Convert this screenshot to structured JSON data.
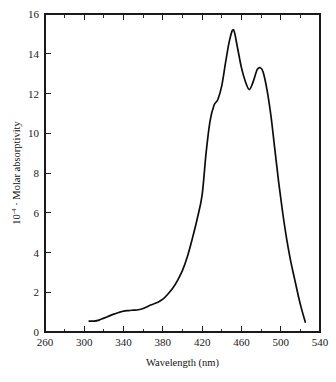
{
  "figure": {
    "background_color": "#ffffff",
    "ink_color": "#0d0d0d"
  },
  "chart_data": {
    "type": "line",
    "title": "",
    "subtitle": "",
    "xlabel": "Wavelength (nm)",
    "ylabel_prefix": "10",
    "ylabel_exponent": "-4",
    "ylabel_separator": " · ",
    "ylabel_text": "Molar absorptivity",
    "ylabel": "10-4 · Molar absorptivity",
    "xlim": [
      260,
      540
    ],
    "ylim": [
      0,
      16
    ],
    "x_major_ticks": [
      260,
      300,
      340,
      380,
      420,
      460,
      500,
      540
    ],
    "x_tick_labels": [
      "260",
      "300",
      "340",
      "380",
      "420",
      "460",
      "500",
      "540"
    ],
    "x_minor_ticks": [
      280,
      320,
      360,
      400,
      440,
      480,
      520
    ],
    "y_major_ticks": [
      0,
      2,
      4,
      6,
      8,
      10,
      12,
      14,
      16
    ],
    "y_tick_labels": [
      "0",
      "2",
      "4",
      "6",
      "8",
      "10",
      "12",
      "14",
      "16"
    ],
    "grid": false,
    "legend": null,
    "legend_position": "none",
    "axis_frame": "box",
    "ticks_direction": "inward",
    "series": [
      {
        "name": "absorption spectrum",
        "color": "#0d0d0d",
        "line_width": 1.7,
        "x": [
          305,
          310,
          315,
          320,
          325,
          330,
          335,
          340,
          345,
          350,
          355,
          360,
          365,
          370,
          375,
          380,
          385,
          390,
          395,
          400,
          405,
          410,
          415,
          420,
          424,
          428,
          432,
          436,
          440,
          444,
          448,
          452,
          456,
          460,
          464,
          468,
          472,
          476,
          479,
          482,
          486,
          490,
          494,
          498,
          502,
          506,
          510,
          514,
          518,
          521,
          525
        ],
        "y": [
          0.55,
          0.55,
          0.6,
          0.7,
          0.8,
          0.9,
          0.98,
          1.05,
          1.08,
          1.1,
          1.12,
          1.18,
          1.3,
          1.4,
          1.5,
          1.65,
          1.9,
          2.2,
          2.6,
          3.1,
          3.8,
          4.7,
          5.7,
          6.9,
          9.0,
          10.6,
          11.4,
          11.7,
          12.4,
          13.6,
          14.7,
          15.2,
          14.3,
          13.3,
          12.6,
          12.2,
          12.6,
          13.2,
          13.3,
          13.1,
          12.2,
          10.9,
          9.2,
          7.5,
          6.0,
          4.7,
          3.6,
          2.7,
          1.8,
          1.2,
          0.5
        ]
      }
    ],
    "annotations": [
      {
        "label": "main peak",
        "x": 452,
        "y": 15.2
      },
      {
        "label": "shoulder",
        "x": 428,
        "y": 10.6
      },
      {
        "label": "valley",
        "x": 468,
        "y": 12.2
      },
      {
        "label": "secondary peak",
        "x": 479,
        "y": 13.3
      },
      {
        "label": "left tail start",
        "x": 305,
        "y": 0.55
      },
      {
        "label": "right tail end",
        "x": 525,
        "y": 0.5
      }
    ]
  }
}
